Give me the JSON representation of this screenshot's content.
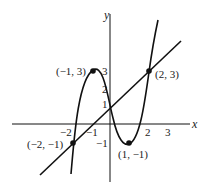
{
  "diagram": {
    "axes": {
      "x_label": "x",
      "y_label": "y"
    },
    "x_ticks": [
      "−2",
      "−1",
      "2",
      "3"
    ],
    "y_ticks": [
      "3",
      "2",
      "1",
      "−1"
    ],
    "curves": [
      {
        "type": "cubic",
        "description": "cubic through (-2,-1), (-1,3), (1,-1), (2,3)"
      },
      {
        "type": "line",
        "description": "line through (-2,-1) and (2,3), y = x + 1"
      }
    ],
    "points": [
      {
        "label": "(−1, 3)",
        "x": -1,
        "y": 3
      },
      {
        "label": "(2, 3)",
        "x": 2,
        "y": 3
      },
      {
        "label": "(−2, −1)",
        "x": -2,
        "y": -1
      },
      {
        "label": "(1, −1)",
        "x": 1,
        "y": -1
      }
    ],
    "colors": {
      "stroke": "#111111",
      "background": "#ffffff"
    }
  }
}
